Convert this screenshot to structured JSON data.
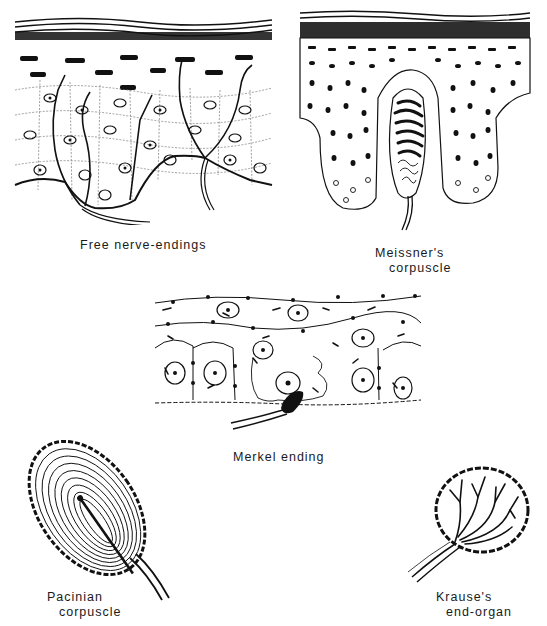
{
  "figure": {
    "panels": [
      {
        "id": "free",
        "label_lines": [
          "Free nerve-endings"
        ]
      },
      {
        "id": "meissner",
        "label_lines": [
          "Meissner's",
          "corpuscle"
        ]
      },
      {
        "id": "merkel",
        "label_lines": [
          "Merkel ending"
        ]
      },
      {
        "id": "pacinian",
        "label_lines": [
          "Pacinian",
          "corpuscle"
        ]
      },
      {
        "id": "krause",
        "label_lines": [
          "Krause's",
          "end-organ"
        ]
      }
    ]
  },
  "colors": {
    "ink": "#111111",
    "background": "#ffffff"
  }
}
